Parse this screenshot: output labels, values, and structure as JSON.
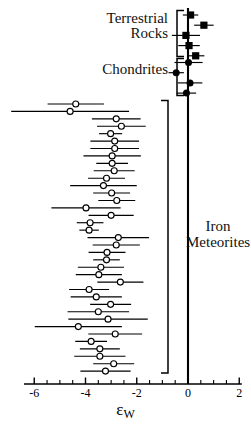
{
  "chart_data": {
    "type": "scatter",
    "title": "",
    "xlabel": "epsilon_W",
    "xlabel_base": "ε",
    "xlabel_sub": "W",
    "ylabel": "",
    "xlim": [
      -6.4,
      2.2
    ],
    "xticks": [
      -6,
      -4,
      -2,
      0,
      2
    ],
    "xticklabels": [
      "-6",
      "-4",
      "-2",
      "0",
      "2"
    ],
    "xminorticks": [
      -5.5,
      -5,
      -4.5,
      -3.5,
      -3,
      -2.5,
      -1.5,
      -1,
      -0.5,
      0.5,
      1,
      1.5
    ],
    "grid": false,
    "legend": "none",
    "reference_line_x": 0,
    "orientation": "horizontal-errorbars",
    "series": [
      {
        "name": "Terrestrial Rocks",
        "marker": "filled-square",
        "color": "#000000",
        "points": [
          {
            "x": 0.1,
            "xerr": 0.3,
            "row": 0
          },
          {
            "x": 0.62,
            "xerr": 0.38,
            "row": 1
          },
          {
            "x": -0.08,
            "xerr": 0.55,
            "row": 2
          },
          {
            "x": 0.04,
            "xerr": 0.42,
            "row": 3
          },
          {
            "x": 0.3,
            "xerr": 0.34,
            "row": 4
          }
        ]
      },
      {
        "name": "Chondrites",
        "marker": "filled-circle",
        "color": "#000000",
        "points": [
          {
            "x": 0.02,
            "xerr": 0.55,
            "row": 0
          },
          {
            "x": -0.46,
            "xerr": 0.3,
            "row": 1
          },
          {
            "x": 0.08,
            "xerr": 0.48,
            "row": 2
          },
          {
            "x": -0.06,
            "xerr": 0.38,
            "row": 3
          }
        ]
      },
      {
        "name": "Iron Meteorites",
        "marker": "open-circle",
        "color": "#000000",
        "points": [
          {
            "x": -4.38,
            "xerr": 1.1,
            "row": 0
          },
          {
            "x": -4.6,
            "xerr": 2.3,
            "row": 1
          },
          {
            "x": -2.8,
            "xerr": 0.95,
            "row": 2
          },
          {
            "x": -2.6,
            "xerr": 0.95,
            "row": 3
          },
          {
            "x": -3.02,
            "xerr": 0.45,
            "row": 4
          },
          {
            "x": -2.86,
            "xerr": 0.95,
            "row": 5
          },
          {
            "x": -2.86,
            "xerr": 0.95,
            "row": 6
          },
          {
            "x": -2.96,
            "xerr": 1.12,
            "row": 7
          },
          {
            "x": -2.96,
            "xerr": 0.62,
            "row": 8
          },
          {
            "x": -2.88,
            "xerr": 0.8,
            "row": 9
          },
          {
            "x": -3.18,
            "xerr": 0.72,
            "row": 10
          },
          {
            "x": -3.3,
            "xerr": 1.3,
            "row": 11
          },
          {
            "x": -2.98,
            "xerr": 0.72,
            "row": 12
          },
          {
            "x": -2.78,
            "xerr": 0.72,
            "row": 13
          },
          {
            "x": -3.98,
            "xerr": 1.35,
            "row": 14
          },
          {
            "x": -3.0,
            "xerr": 0.88,
            "row": 15
          },
          {
            "x": -3.82,
            "xerr": 0.52,
            "row": 16
          },
          {
            "x": -3.86,
            "xerr": 0.38,
            "row": 17
          },
          {
            "x": -2.72,
            "xerr": 1.2,
            "row": 18
          },
          {
            "x": -2.8,
            "xerr": 0.92,
            "row": 19
          },
          {
            "x": -3.16,
            "xerr": 0.72,
            "row": 20
          },
          {
            "x": -3.18,
            "xerr": 0.52,
            "row": 21
          },
          {
            "x": -3.4,
            "xerr": 0.9,
            "row": 22
          },
          {
            "x": -3.48,
            "xerr": 0.9,
            "row": 23
          },
          {
            "x": -2.64,
            "xerr": 0.9,
            "row": 24
          },
          {
            "x": -3.86,
            "xerr": 0.78,
            "row": 25
          },
          {
            "x": -3.58,
            "xerr": 1.0,
            "row": 26
          },
          {
            "x": -3.02,
            "xerr": 0.8,
            "row": 27
          },
          {
            "x": -3.5,
            "xerr": 1.2,
            "row": 28
          },
          {
            "x": -3.12,
            "xerr": 1.55,
            "row": 29
          },
          {
            "x": -4.28,
            "xerr": 1.7,
            "row": 30
          },
          {
            "x": -2.84,
            "xerr": 1.05,
            "row": 31
          },
          {
            "x": -3.78,
            "xerr": 0.62,
            "row": 32
          },
          {
            "x": -3.44,
            "xerr": 0.78,
            "row": 33
          },
          {
            "x": -3.44,
            "xerr": 1.0,
            "row": 34
          },
          {
            "x": -2.9,
            "xerr": 0.8,
            "row": 35
          },
          {
            "x": -3.22,
            "xerr": 0.98,
            "row": 36
          }
        ]
      }
    ]
  },
  "labels": {
    "terrestrial": "Terrestrial\nRocks",
    "chondrites": "Chondrites",
    "iron": "Iron\nMeteorites"
  },
  "axis": {
    "title_base": "ε",
    "title_sub": "W",
    "tick_labels": [
      "-6",
      "-4",
      "-2",
      "0",
      "2"
    ]
  },
  "brackets": [
    {
      "name": "terrestrial-bracket"
    },
    {
      "name": "chondrites-bracket"
    },
    {
      "name": "iron-bracket"
    }
  ],
  "colors": {
    "ink": "#000000",
    "background": "#ffffff"
  }
}
